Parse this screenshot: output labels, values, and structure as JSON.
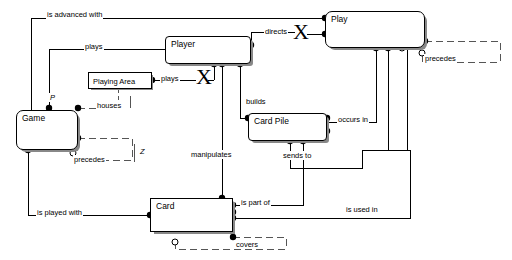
{
  "diagram": {
    "type": "entity-relationship-diagram",
    "colors": {
      "line": "#000000",
      "background": "#ffffff",
      "shadow": "#888888",
      "dashed": "#555555"
    },
    "entities": [
      {
        "id": "game",
        "label": "Game",
        "x": 16,
        "y": 110,
        "w": 62,
        "h": 40
      },
      {
        "id": "player",
        "label": "Player",
        "x": 165,
        "y": 36,
        "w": 86,
        "h": 28
      },
      {
        "id": "play",
        "label": "Play",
        "x": 325,
        "y": 11,
        "w": 100,
        "h": 37
      },
      {
        "id": "playing_area",
        "label": "Playing Area",
        "x": 88,
        "y": 72,
        "w": 64,
        "h": 17
      },
      {
        "id": "card_pile",
        "label": "Card Pile",
        "x": 248,
        "y": 113,
        "w": 79,
        "h": 28
      },
      {
        "id": "card",
        "label": "Card",
        "x": 150,
        "y": 198,
        "w": 83,
        "h": 34
      }
    ],
    "relationship_labels": [
      {
        "id": "is-advanced-with",
        "text": "is advanced with",
        "x": 46,
        "y": 10
      },
      {
        "id": "plays-game",
        "text": "plays",
        "x": 84,
        "y": 42
      },
      {
        "id": "plays-area",
        "text": "plays",
        "x": 160,
        "y": 79
      },
      {
        "id": "directs",
        "text": "directs",
        "x": 264,
        "y": 31
      },
      {
        "id": "precedes-play",
        "text": "precedes",
        "x": 424,
        "y": 57
      },
      {
        "id": "houses",
        "text": "houses",
        "x": 96,
        "y": 104
      },
      {
        "id": "builds",
        "text": "builds",
        "x": 245,
        "y": 100
      },
      {
        "id": "occurs-in",
        "text": "occurs in",
        "x": 337,
        "y": 118
      },
      {
        "id": "precedes-game",
        "text": "precedes",
        "x": 73,
        "y": 158
      },
      {
        "id": "manipulates",
        "text": "manipulates",
        "x": 190,
        "y": 153
      },
      {
        "id": "sends-to",
        "text": "sends to",
        "x": 282,
        "y": 154
      },
      {
        "id": "is-part-of",
        "text": "is part of",
        "x": 240,
        "y": 200
      },
      {
        "id": "is-used-in",
        "text": "is used in",
        "x": 345,
        "y": 208
      },
      {
        "id": "is-played-with",
        "text": "is played with",
        "x": 36,
        "y": 211
      },
      {
        "id": "covers",
        "text": "covers",
        "x": 235,
        "y": 243
      }
    ],
    "annotations": [
      {
        "id": "ann-p",
        "text": "P",
        "x": 49,
        "y": 96
      },
      {
        "id": "ann-z",
        "text": "Z",
        "x": 139,
        "y": 150
      }
    ],
    "uniqueness_marks": [
      {
        "id": "x-mark-playing-area",
        "text": "X",
        "x": 196,
        "y": 68
      },
      {
        "id": "x-mark-player-play",
        "text": "X",
        "x": 295,
        "y": 26
      }
    ]
  }
}
